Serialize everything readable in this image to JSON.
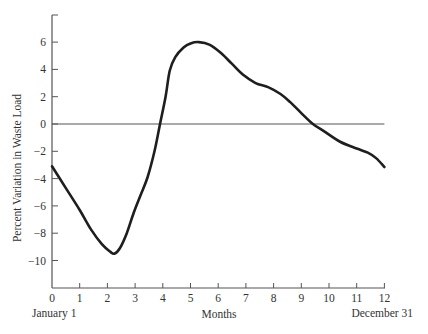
{
  "chart_data": {
    "type": "line",
    "title": "",
    "xlabel": "Months",
    "ylabel": "Percent Variation in Waste Load",
    "xlim": [
      0,
      12
    ],
    "ylim": [
      -12,
      8
    ],
    "grid": false,
    "legend": null,
    "x_ticks": [
      0,
      1,
      2,
      3,
      4,
      5,
      6,
      7,
      8,
      9,
      10,
      11,
      12
    ],
    "y_ticks": [
      6,
      4,
      2,
      0,
      -2,
      -4,
      -6,
      -8,
      -10
    ],
    "y_tick_labels": [
      "6",
      "4",
      "2",
      "0",
      "−2",
      "−4",
      "−6",
      "−8",
      "−10"
    ],
    "x_annotations": [
      {
        "x": 0,
        "text": "January 1"
      },
      {
        "x": 12,
        "text": "December 31"
      }
    ],
    "reference_line": {
      "y": 0,
      "x_range": [
        0,
        12
      ]
    },
    "series": [
      {
        "name": "Percent Variation in Waste Load",
        "x": [
          0,
          0.5,
          1.0,
          1.4,
          1.8,
          2.1,
          2.25,
          2.45,
          2.7,
          2.95,
          3.2,
          3.45,
          3.7,
          3.9,
          4.1,
          4.25,
          4.45,
          4.75,
          5.0,
          5.3,
          5.7,
          6.1,
          6.5,
          6.9,
          7.35,
          7.8,
          8.25,
          8.6,
          9.0,
          9.42,
          9.8,
          10.4,
          11.0,
          11.4,
          11.7,
          12.0
        ],
        "values": [
          -3.1,
          -4.7,
          -6.3,
          -7.7,
          -8.8,
          -9.35,
          -9.5,
          -9.1,
          -8.0,
          -6.5,
          -5.2,
          -3.9,
          -2.0,
          0.0,
          2.0,
          3.9,
          4.9,
          5.6,
          5.9,
          6.0,
          5.8,
          5.2,
          4.4,
          3.6,
          3.0,
          2.7,
          2.2,
          1.6,
          0.8,
          0.0,
          -0.5,
          -1.3,
          -1.8,
          -2.1,
          -2.5,
          -3.15
        ]
      }
    ]
  }
}
